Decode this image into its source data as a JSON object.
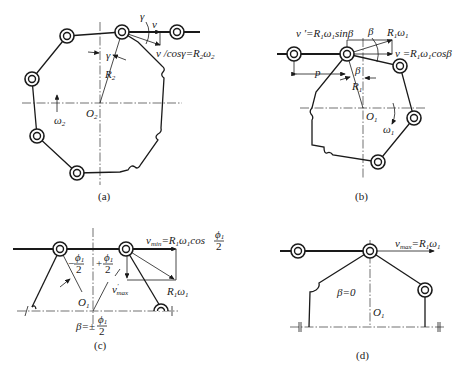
{
  "figure": {
    "panels": [
      {
        "id": "a",
        "caption": "(a)",
        "labels": {
          "center": "O",
          "center_sub": "2",
          "radius": "R",
          "radius_sub": "2",
          "angle1": "γ",
          "angle2": "γ",
          "velocity": "v",
          "relation": "v /cosγ=R",
          "relation_sub": "2",
          "relation_omega": "ω",
          "relation_omega_sub": "2",
          "omega": "ω",
          "omega_sub": "2"
        }
      },
      {
        "id": "b",
        "caption": "(b)",
        "labels": {
          "vprime": "v '=R",
          "vprime_sub1": "1",
          "vprime_omega": "ω",
          "vprime_sub2": "1",
          "vprime_tail": "sinβ",
          "beta_top": "β",
          "r_omega": "R",
          "r_omega_sub1": "1",
          "r_omega_w": "ω",
          "r_omega_sub2": "1",
          "v_eq": "v =R",
          "v_eq_sub1": "1",
          "v_eq_omega": "ω",
          "v_eq_sub2": "1",
          "v_eq_tail": "cosβ",
          "pitch": "p",
          "beta_mid": "β",
          "radius": "R",
          "radius_sub": "1",
          "center": "O",
          "center_sub": "1",
          "omega": "ω",
          "omega_sub": "1"
        }
      },
      {
        "id": "c",
        "caption": "(c)",
        "labels": {
          "vmin": "v",
          "vmin_sub": "min",
          "vmin_eq": "=R",
          "vmin_sub1": "1",
          "vmin_omega": "ω",
          "vmin_sub2": "1",
          "vmin_cos": "cos",
          "phi": "ϕ",
          "phi_sub": "1",
          "two": "2",
          "minus_half": "−",
          "plus_half": "+",
          "vmax_prime": "v",
          "vmax_prime_sup": "'",
          "vmax_prime_sub": "max",
          "r_omega": "R",
          "r_omega_sub1": "1",
          "r_omega_w": "ω",
          "r_omega_sub2": "1",
          "center": "O",
          "center_sub": "1",
          "beta_eq": "β=±"
        }
      },
      {
        "id": "d",
        "caption": "(d)",
        "labels": {
          "vmax": "v",
          "vmax_sub": "max",
          "vmax_eq": "=R",
          "vmax_sub1": "1",
          "vmax_omega": "ω",
          "vmax_sub2": "1",
          "beta_zero": "β=0",
          "center": "O",
          "center_sub": "1"
        }
      }
    ]
  }
}
